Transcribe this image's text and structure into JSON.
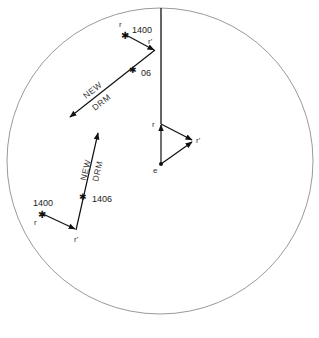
{
  "diagram": {
    "type": "radar relative-motion plot",
    "circle": {
      "cx": 160,
      "cy": 161,
      "r": 153,
      "stroke": "#999999"
    },
    "heading_line": {
      "label": ""
    },
    "own_ship_triangle": {
      "e_label": "e",
      "r_label": "r",
      "r_prime_label": "r'"
    },
    "upper_plot": {
      "r_label": "r",
      "time_label": "1400",
      "r_prime_label": "r'",
      "tick_label": "06",
      "drm_line1": "NEW",
      "drm_line2": "DRM"
    },
    "lower_plot": {
      "r_label": "r",
      "time_label": "1400",
      "r_prime_label": "r'",
      "tick_label": "1406",
      "drm_line1": "NEW",
      "drm_line2": "DRM"
    }
  }
}
